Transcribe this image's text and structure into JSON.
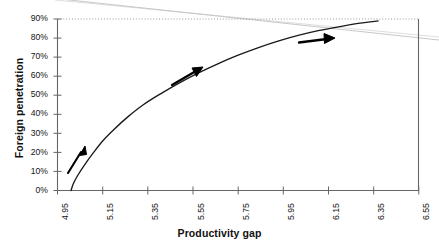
{
  "chart_data": {
    "type": "line",
    "title": "",
    "xlabel": "Productivity gap",
    "ylabel": "Foreign penetration",
    "xlim": [
      4.95,
      6.55
    ],
    "ylim": [
      0,
      90
    ],
    "grid": false,
    "gridlines": [
      "90%"
    ],
    "legend": "none",
    "x_ticks": [
      "4.95",
      "5.15",
      "5.35",
      "5.55",
      "5.75",
      "5.95",
      "6.15",
      "6.35",
      "6.55"
    ],
    "x_tick_values": [
      4.95,
      5.15,
      5.35,
      5.55,
      5.75,
      5.95,
      6.15,
      6.35,
      6.55
    ],
    "y_ticks": [
      "0%",
      "10%",
      "20%",
      "30%",
      "40%",
      "50%",
      "60%",
      "70%",
      "80%",
      "90%"
    ],
    "y_tick_values": [
      0,
      10,
      20,
      30,
      40,
      50,
      60,
      70,
      80,
      90
    ],
    "series": [
      {
        "name": "Foreign penetration curve",
        "x": [
          5.01,
          5.02,
          5.04,
          5.07,
          5.11,
          5.15,
          5.2,
          5.26,
          5.33,
          5.41,
          5.49,
          5.57,
          5.66,
          5.75,
          5.84,
          5.93,
          6.02,
          6.11,
          6.2,
          6.29,
          6.37
        ],
        "y": [
          0.0,
          3.5,
          8.0,
          13.5,
          20.0,
          26.0,
          32.0,
          38.5,
          45.0,
          51.0,
          56.5,
          61.5,
          66.5,
          71.0,
          75.0,
          78.5,
          81.5,
          84.0,
          86.0,
          87.8,
          89.0
        ]
      }
    ],
    "annotations": [
      {
        "name": "direction-arrow-1",
        "x1": 5.05,
        "y1": 9.0,
        "x2": 5.1,
        "y2": 21.0,
        "style": "solid-arrow"
      },
      {
        "name": "direction-arrow-2",
        "x1": 5.51,
        "y1": 55.0,
        "x2": 5.62,
        "y2": 64.0,
        "style": "solid-arrow"
      },
      {
        "name": "direction-arrow-3",
        "x1": 6.07,
        "y1": 79.0,
        "x2": 6.2,
        "y2": 81.5,
        "style": "solid-arrow"
      }
    ],
    "colors": {
      "curve": "#1a1a1a",
      "axis": "#555555",
      "arrow": "#000000",
      "gridline": "#999999",
      "background": "#ffffff"
    }
  },
  "axes": {
    "x_title": "Productivity gap",
    "y_title": "Foreign penetration"
  }
}
